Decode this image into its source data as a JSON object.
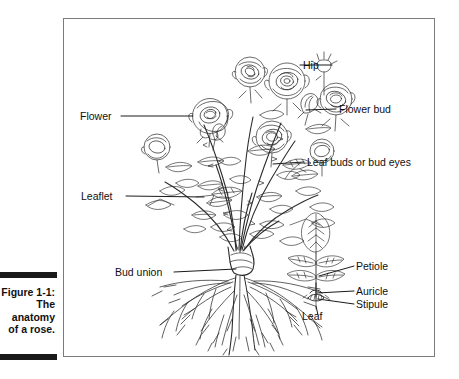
{
  "figure": {
    "caption_title": "Figure 1-1:",
    "caption_body": "The anatomy of a rose.",
    "alt": "Line illustration of a rose bush showing flowers, buds, leaves and root system with labelled parts"
  },
  "labels": {
    "hip": "Hip",
    "flower_bud": "Flower bud",
    "leaf_buds": "Leaf buds or bud eyes",
    "flower": "Flower",
    "leaflet": "Leaflet",
    "bud_union": "Bud union",
    "petiole": "Petiole",
    "auricle": "Auricle",
    "stipule": "Stipule",
    "leaf": "Leaf"
  },
  "colors": {
    "ink": "#1a1a1a",
    "frame": "#7b7b7b",
    "paper": "#ffffff",
    "caption_rule": "#1a1a1a"
  },
  "illustration": {
    "subject": "rose-bush-anatomy",
    "detail_inset": "leaf-detail",
    "parts_shown": [
      "hip",
      "flower-bud",
      "leaf-buds-or-bud-eyes",
      "flower",
      "leaflet",
      "bud-union",
      "petiole",
      "auricle",
      "stipule",
      "leaf",
      "roots"
    ]
  }
}
